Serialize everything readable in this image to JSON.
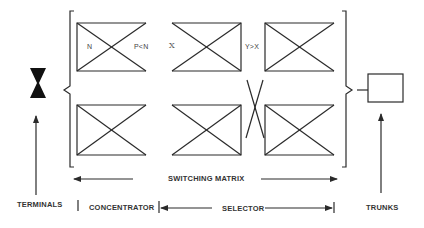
{
  "diagram": {
    "labels": {
      "n": "N",
      "p_lt_n": "P<N",
      "x": "X",
      "y_gt_x": "Y>X",
      "switching_matrix": "SWITCHING MATRIX",
      "terminals": "TERMINALS",
      "concentrator": "CONCENTRATOR",
      "selector": "SELECTOR",
      "trunks": "TRUNKS"
    },
    "stages": [
      {
        "id": "concentrator",
        "label": "CONCENTRATOR",
        "inputs": "N",
        "outputs": "P<N"
      },
      {
        "id": "selector",
        "label": "SELECTOR",
        "inputs": "X",
        "outputs": "Y>X"
      }
    ],
    "colors": {
      "line": "#2a2a2a",
      "fill": "#111111",
      "text": "#333333",
      "background": "#ffffff"
    }
  }
}
